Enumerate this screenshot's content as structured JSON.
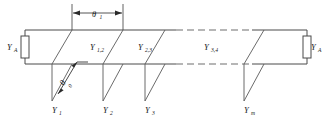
{
  "figure": {
    "type": "schematic-diagram",
    "background_color": "#ffffff",
    "line_color": "#4a4a4a",
    "label_color": "#1a1a1a"
  },
  "terminations": {
    "left": {
      "symbol": "Y",
      "subscript": "A",
      "name": "left-termination-admittance"
    },
    "right": {
      "symbol": "Y",
      "subscript": "A",
      "name": "right-termination-admittance"
    }
  },
  "line_sections": [
    {
      "symbol": "Y",
      "subscript": "1,2",
      "x": 98,
      "y": 47
    },
    {
      "symbol": "Y",
      "subscript": "2,3",
      "x": 147,
      "y": 47
    },
    {
      "symbol": "Y",
      "subscript": "3,4",
      "x": 212,
      "y": 47
    }
  ],
  "stubs": [
    {
      "symbol": "Y",
      "subscript": "1",
      "label_x": 62,
      "label_y": 113,
      "top_x": 72,
      "bot_x": 52
    },
    {
      "symbol": "Y",
      "subscript": "2",
      "label_x": 111,
      "label_y": 113,
      "top_x": 123,
      "bot_x": 103
    },
    {
      "symbol": "Y",
      "subscript": "3",
      "label_x": 152,
      "label_y": 113,
      "top_x": 165,
      "bot_x": 145
    },
    {
      "symbol": "Y",
      "subscript": "m",
      "label_x": 251,
      "label_y": 113,
      "top_x": 264,
      "bot_x": 244
    }
  ],
  "dimensions": {
    "spacing": {
      "symbol": "θ",
      "subscript": "1",
      "label_x": 97,
      "label_y": 14,
      "start_x": 72,
      "end_x": 123,
      "y": 13,
      "name": "stub-spacing-dimension"
    },
    "stub_length": {
      "symbol": "θ",
      "subscript": "0",
      "label_x": 67,
      "label_y": 84,
      "name": "stub-length-dimension"
    }
  },
  "rails": {
    "top_y": 30,
    "bottom_y": 64,
    "left_x": 25,
    "right_x": 307,
    "dash_start_x": 176,
    "dash_end_x": 252
  }
}
